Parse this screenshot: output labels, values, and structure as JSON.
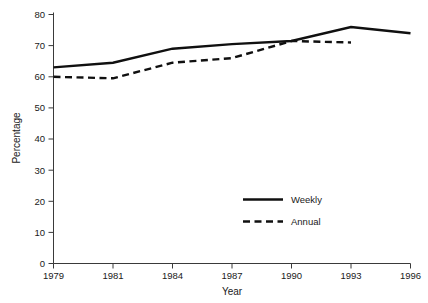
{
  "chart_data": {
    "type": "line",
    "title": "",
    "xlabel": "Year",
    "ylabel": "Percentage",
    "categories": [
      "1979",
      "1981",
      "1984",
      "1987",
      "1990",
      "1993",
      "1996"
    ],
    "ylim": [
      0,
      80
    ],
    "yticks": [
      0,
      10,
      20,
      30,
      40,
      50,
      60,
      70,
      80
    ],
    "grid": false,
    "legend_position": "inside lower-right",
    "series": [
      {
        "name": "Weekly",
        "style": "solid",
        "color": "#101010",
        "x": [
          "1979",
          "1981",
          "1984",
          "1987",
          "1990",
          "1993",
          "1996"
        ],
        "values": [
          63,
          64.5,
          69,
          70.5,
          71.5,
          76,
          74
        ]
      },
      {
        "name": "Annual",
        "style": "dashed",
        "color": "#101010",
        "x": [
          "1979",
          "1981",
          "1984",
          "1987",
          "1990",
          "1993"
        ],
        "values": [
          60,
          59.5,
          64.5,
          66,
          71.5,
          71
        ]
      }
    ]
  },
  "axes": {
    "y_tick_labels": [
      "0",
      "10",
      "20",
      "30",
      "40",
      "50",
      "60",
      "70",
      "80"
    ],
    "x_tick_labels": [
      "1979",
      "1981",
      "1984",
      "1987",
      "1990",
      "1993",
      "1996"
    ],
    "y_axis_title": "Percentage",
    "x_axis_title": "Year"
  },
  "legend": {
    "entries": [
      {
        "label": "Weekly",
        "style": "solid"
      },
      {
        "label": "Annual",
        "style": "dashed"
      }
    ]
  },
  "caption": {
    "text": ""
  }
}
